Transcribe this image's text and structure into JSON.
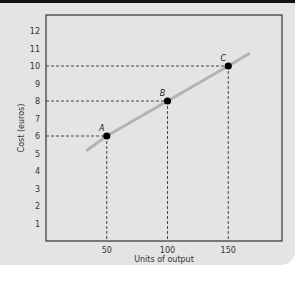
{
  "chart_data": {
    "type": "line",
    "title": "",
    "xlabel": "Units of output",
    "ylabel": "Cost (euros)",
    "xlim": [
      0,
      195
    ],
    "ylim": [
      0,
      13
    ],
    "x_ticks": [
      "50",
      "100",
      "150"
    ],
    "y_ticks": [
      "1",
      "2",
      "3",
      "4",
      "5",
      "6",
      "7",
      "8",
      "9",
      "10",
      "11",
      "12"
    ],
    "grid": false,
    "legend": null,
    "series": [
      {
        "name": "Cost line",
        "x": [
          34,
          50,
          100,
          150,
          167
        ],
        "y": [
          5.2,
          6,
          8,
          10,
          10.7
        ],
        "color": "#b3b3b3"
      }
    ],
    "points": [
      {
        "label": "A",
        "x": 50,
        "y": 6
      },
      {
        "label": "B",
        "x": 100,
        "y": 8
      },
      {
        "label": "C",
        "x": 150,
        "y": 10
      }
    ],
    "annotations": "Dashed reference lines drop from each labeled point to both axes"
  },
  "colors": {
    "panel_bg": "#e4e4e4",
    "topbar": "#111111",
    "axis": "#333333",
    "line": "#b3b3b3",
    "point": "#000000"
  }
}
